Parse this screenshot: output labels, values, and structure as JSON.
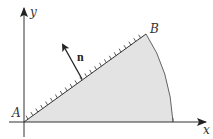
{
  "diagram": {
    "labels": {
      "y_axis": "y",
      "x_axis": "x",
      "point_a": "A",
      "point_b": "B",
      "normal": "n"
    },
    "colors": {
      "fill": "#e3e3e3",
      "stroke": "#444444"
    },
    "elements": [
      "x-axis with arrow",
      "y-axis with arrow",
      "line segment AB with hatching on upper-left side",
      "circular arc from B to x-axis",
      "shaded sector region",
      "normal vector n pointing up-left from AB"
    ]
  }
}
